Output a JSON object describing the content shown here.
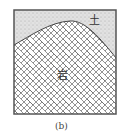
{
  "figure": {
    "caption": "(b)",
    "layers": [
      {
        "name": "soil",
        "label": "土",
        "pattern": "stipple",
        "color": "#d9d9d9"
      },
      {
        "name": "rock",
        "label": "岩",
        "pattern": "herringbone-brick",
        "color": "#ffffff"
      }
    ],
    "boundary": "convex-up curve; rock surface rises from left edge, peaks near center-right, falls toward right edge",
    "border_color": "#555555"
  }
}
